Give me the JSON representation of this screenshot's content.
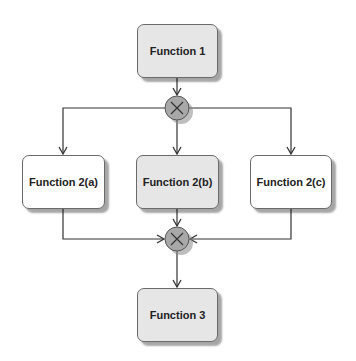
{
  "diagram": {
    "nodes": [
      {
        "id": "f1",
        "label": "Function 1",
        "style": "gray"
      },
      {
        "id": "f2a",
        "label": "Function 2(a)",
        "style": "white"
      },
      {
        "id": "f2b",
        "label": "Function 2(b)",
        "style": "gray"
      },
      {
        "id": "f2c",
        "label": "Function 2(c)",
        "style": "white"
      },
      {
        "id": "f3",
        "label": "Function 3",
        "style": "gray"
      }
    ],
    "connectors": [
      {
        "id": "split",
        "type": "XOR",
        "symbol": "×"
      },
      {
        "id": "join",
        "type": "XOR",
        "symbol": "×"
      }
    ],
    "edges": [
      {
        "from": "f1",
        "to": "split"
      },
      {
        "from": "split",
        "to": "f2a"
      },
      {
        "from": "split",
        "to": "f2b"
      },
      {
        "from": "split",
        "to": "f2c"
      },
      {
        "from": "f2a",
        "to": "join"
      },
      {
        "from": "f2b",
        "to": "join"
      },
      {
        "from": "f2c",
        "to": "join"
      },
      {
        "from": "join",
        "to": "f3"
      }
    ],
    "colors": {
      "gray_fill": "#e6e6e6",
      "white_fill": "#ffffff",
      "connector_fill": "#a8a8a8",
      "line": "#333333"
    }
  }
}
